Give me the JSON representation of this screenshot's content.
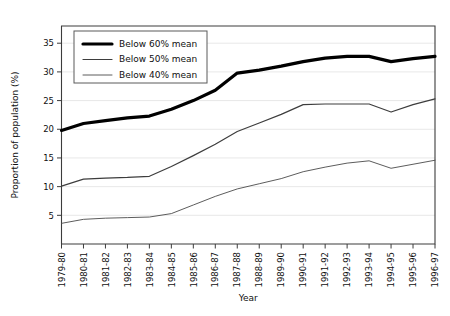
{
  "chart_data": {
    "type": "line",
    "title": "",
    "xlabel": "Year",
    "ylabel": "Proportion of population (%)",
    "categories": [
      "1979-80",
      "1980-81",
      "1981-82",
      "1982-83",
      "1983-84",
      "1984-85",
      "1985-86",
      "1986-87",
      "1987-88",
      "1988-89",
      "1989-90",
      "1990-91",
      "1991-92",
      "1992-93",
      "1993-94",
      "1994-95",
      "1995-96",
      "1996-97"
    ],
    "series": [
      {
        "name": "Below 60% mean",
        "values": [
          19.8,
          21.0,
          21.5,
          22.0,
          22.3,
          23.5,
          25.0,
          26.8,
          29.8,
          30.3,
          31.0,
          31.8,
          32.4,
          32.7,
          32.7,
          31.8,
          32.3,
          32.7
        ],
        "stroke_width": 3.2,
        "color": "#000000"
      },
      {
        "name": "Below 50% mean",
        "values": [
          10.1,
          11.3,
          11.5,
          11.6,
          11.8,
          13.5,
          15.4,
          17.4,
          19.6,
          21.1,
          22.6,
          24.3,
          24.4,
          24.4,
          24.4,
          23.0,
          24.3,
          25.3
        ],
        "stroke_width": 1.2,
        "color": "#3d3d3d"
      },
      {
        "name": "Below 40% mean",
        "values": [
          3.6,
          4.3,
          4.5,
          4.6,
          4.7,
          5.3,
          6.8,
          8.3,
          9.6,
          10.5,
          11.4,
          12.6,
          13.4,
          14.1,
          14.5,
          13.2,
          13.9,
          14.6
        ],
        "stroke_width": 0.9,
        "color": "#4a4a4a"
      }
    ],
    "y_ticks": [
      5,
      10,
      15,
      20,
      25,
      30,
      35
    ],
    "ylim": [
      0,
      38
    ],
    "grid": true,
    "legend_position": "top-left"
  }
}
